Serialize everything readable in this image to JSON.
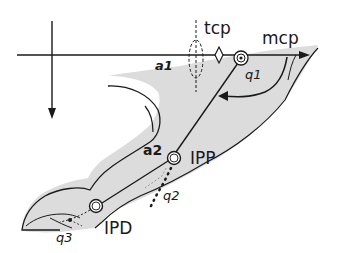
{
  "diagram": {
    "colors": {
      "finger_fill": "#dcdcdc",
      "stroke": "#1a1a1a",
      "background": "#ffffff"
    },
    "labels": {
      "tcp": "tcp",
      "mcp": "mcp",
      "a1": "a1",
      "q1": "q1",
      "a2": "a2",
      "ipp": "IPP",
      "q2": "q2",
      "ipd": "IPD",
      "q3": "q3"
    },
    "joints": [
      {
        "id": "mcp",
        "label": "mcp",
        "x": 241,
        "y": 58
      },
      {
        "id": "ipp",
        "label": "IPP",
        "x": 174,
        "y": 158
      },
      {
        "id": "ipd",
        "label": "IPD",
        "x": 96,
        "y": 206
      }
    ],
    "links": [
      {
        "id": "a1",
        "from": "tcp",
        "to": "mcp"
      },
      {
        "id": "a2",
        "from": "mcp",
        "to": "ipp"
      },
      {
        "id": "a3",
        "from": "ipp",
        "to": "ipd"
      }
    ],
    "angles": [
      "q1",
      "q2",
      "q3"
    ],
    "axes": {
      "horizontal": {
        "y": 55,
        "x_start": 17,
        "x_end": 310
      },
      "vertical": {
        "x": 52,
        "y_start": 21,
        "y_end": 118
      }
    }
  }
}
